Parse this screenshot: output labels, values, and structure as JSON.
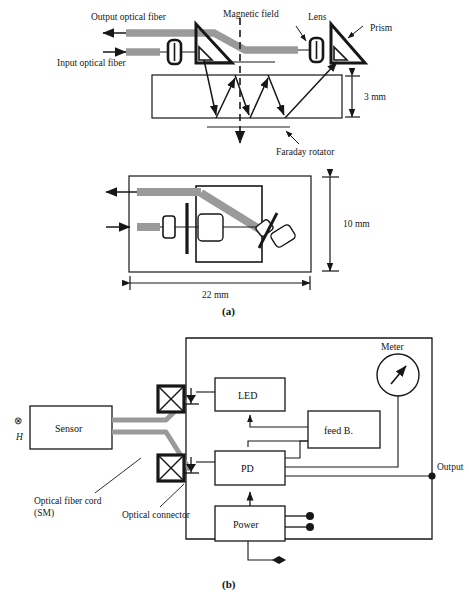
{
  "figure": {
    "panel_a": {
      "caption": "(a)",
      "side_view": {
        "labels": {
          "output_fiber": "Output optical fiber",
          "input_fiber": "Input optical fiber",
          "magnetic_field": "Magnetic field",
          "lens": "Lens",
          "prism": "Prism",
          "faraday_rotator": "Faraday rotator",
          "thickness": "3 mm"
        }
      },
      "top_view": {
        "labels": {
          "height": "10 mm",
          "length": "22 mm"
        }
      }
    },
    "panel_b": {
      "caption": "(b)",
      "labels": {
        "sensor": "Sensor",
        "field_symbol": "⊗",
        "field_name": "H",
        "fiber_cord_line1": "Optical fiber cord",
        "fiber_cord_line2": "(SM)",
        "optical_connector": "Optical connector",
        "led": "LED",
        "pd": "PD",
        "feedback": "feed B.",
        "power": "Power",
        "meter": "Meter",
        "output": "Output"
      }
    }
  },
  "colors": {
    "fiber_gray": "#9a9a9a",
    "line_black": "#171717",
    "background": "#ffffff"
  }
}
